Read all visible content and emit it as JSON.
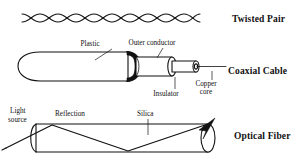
{
  "diagram": {
    "background_color": "#ffffff",
    "ink_color": "#111111"
  },
  "media": [
    {
      "id": "twisted-pair",
      "label": "Twisted Pair",
      "label_x": 232,
      "label_y": 22,
      "twists": 7,
      "start_x": 22,
      "end_x": 200,
      "center_y": 18,
      "amplitude": 6.5
    },
    {
      "id": "coaxial-cable",
      "label": "Coaxial Cable",
      "label_x": 228,
      "label_y": 74,
      "parts": [
        {
          "name": "Plastic",
          "label": "Plastic",
          "label_x": 90,
          "label_y": 46,
          "leader_from_x": 112,
          "leader_from_y": 49,
          "leader_to_x": 95,
          "leader_to_y": 62
        },
        {
          "name": "Outer conductor",
          "label": "Outer conductor",
          "label_x": 152,
          "label_y": 45,
          "leader_from_x": 162,
          "leader_from_y": 48,
          "leader_to_x": 157,
          "leader_to_y": 58
        },
        {
          "name": "Insulator",
          "label": "Insulator",
          "label_x": 166,
          "label_y": 96,
          "leader_from_x": 175,
          "leader_from_y": 89,
          "leader_to_x": 175,
          "leader_to_y": 77
        },
        {
          "name": "Copper core",
          "label_line_1": "Copper",
          "label_line_2": "core",
          "label_x": 206,
          "label_y": 86,
          "leader_from_x": 212,
          "leader_from_y": 80,
          "leader_to_x": 212,
          "leader_to_y": 72
        }
      ]
    },
    {
      "id": "optical-fiber",
      "label": "Optical Fiber",
      "label_x": 234,
      "label_y": 135,
      "parts": [
        {
          "name": "Light source",
          "label_line_1": "Light",
          "label_line_2": "source",
          "label_x": 10,
          "label_y": 113
        },
        {
          "name": "Reflection",
          "label": "Reflection",
          "label_x": 55,
          "label_y": 116
        },
        {
          "name": "Silica",
          "label": "Silica",
          "label_x": 137,
          "label_y": 116,
          "leader_from_x": 148,
          "leader_from_y": 119,
          "leader_to_x": 148,
          "leader_to_y": 133
        }
      ]
    }
  ]
}
